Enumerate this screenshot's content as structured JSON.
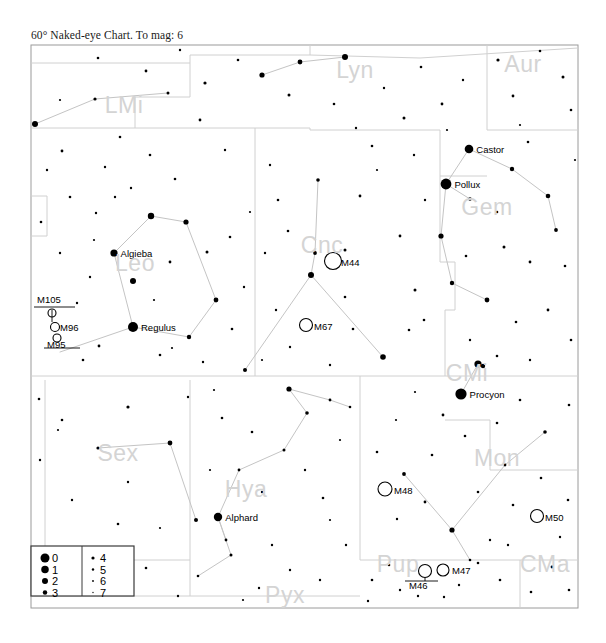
{
  "title": "60° Naked-eye Chart. To mag: 6",
  "chart_data": {
    "type": "scatter",
    "title": "60° Naked-eye Chart. To mag: 6",
    "xlabel": "",
    "ylabel": "",
    "xlim": [
      0,
      1
    ],
    "ylim": [
      0,
      1
    ],
    "grid": false,
    "legend_position": "bottom-left",
    "field_of_view_degrees": 60,
    "limiting_magnitude": 6,
    "legend": {
      "title": "",
      "entries": [
        {
          "mag": "0",
          "size": 9
        },
        {
          "mag": "1",
          "size": 7.5
        },
        {
          "mag": "2",
          "size": 6
        },
        {
          "mag": "3",
          "size": 4.5
        },
        {
          "mag": "4",
          "size": 3.2
        },
        {
          "mag": "5",
          "size": 2.4
        },
        {
          "mag": "6",
          "size": 1.8
        },
        {
          "mag": "7",
          "size": 1.3
        }
      ],
      "left_column": [
        "0",
        "1",
        "2",
        "3"
      ],
      "right_column": [
        "4",
        "5",
        "6",
        "7"
      ]
    },
    "constellations": [
      {
        "abbr": "Lyn",
        "name": "Lynx",
        "x": 355,
        "y": 78
      },
      {
        "abbr": "Aur",
        "name": "Auriga",
        "x": 523,
        "y": 72
      },
      {
        "abbr": "LMi",
        "name": "Leo Minor",
        "x": 124,
        "y": 113
      },
      {
        "abbr": "Gem",
        "name": "Gemini",
        "x": 487,
        "y": 215
      },
      {
        "abbr": "Leo",
        "name": "Leo",
        "x": 135,
        "y": 271
      },
      {
        "abbr": "Cnc",
        "name": "Cancer",
        "x": 322,
        "y": 253
      },
      {
        "abbr": "CMi",
        "name": "Canis Minor",
        "x": 467,
        "y": 381
      },
      {
        "abbr": "Sex",
        "name": "Sextans",
        "x": 118,
        "y": 461
      },
      {
        "abbr": "Mon",
        "name": "Monoceros",
        "x": 497,
        "y": 466
      },
      {
        "abbr": "Hya",
        "name": "Hydra",
        "x": 246,
        "y": 497
      },
      {
        "abbr": "Pup",
        "name": "Puppis",
        "x": 398,
        "y": 572
      },
      {
        "abbr": "CMa",
        "name": "Canis Major",
        "x": 545,
        "y": 572
      },
      {
        "abbr": "Pyx",
        "name": "Pyxis",
        "x": 285,
        "y": 603
      }
    ],
    "named_stars": [
      {
        "name": "Castor",
        "x": 469,
        "y": 149,
        "mag": 1,
        "r": 4.3
      },
      {
        "name": "Pollux",
        "x": 446,
        "y": 184,
        "mag": 1,
        "r": 5.4
      },
      {
        "name": "Algieba",
        "x": 114,
        "y": 253,
        "mag": 2,
        "r": 3.6
      },
      {
        "name": "Regulus",
        "x": 133,
        "y": 327,
        "mag": 1,
        "r": 5.0
      },
      {
        "name": "Procyon",
        "x": 461,
        "y": 394,
        "mag": 0,
        "r": 5.6
      },
      {
        "name": "Alphard",
        "x": 218,
        "y": 517,
        "mag": 2,
        "r": 4.2
      }
    ],
    "deep_sky_objects": [
      {
        "name": "M105",
        "x": 52,
        "y": 313,
        "r": 4.0,
        "label_x": 37,
        "label_y": 303,
        "label_pos": "above"
      },
      {
        "name": "M96",
        "x": 55,
        "y": 327,
        "r": 4.5,
        "label_x": 60,
        "label_y": 331,
        "label_pos": "right"
      },
      {
        "name": "M95",
        "x": 57,
        "y": 338,
        "r": 4.0,
        "label_x": 47,
        "label_y": 348,
        "label_pos": "below"
      },
      {
        "name": "M44",
        "x": 333,
        "y": 261,
        "r": 8.5,
        "label_x": 341,
        "label_y": 266,
        "label_pos": "right"
      },
      {
        "name": "M67",
        "x": 306,
        "y": 325,
        "r": 6.5,
        "label_x": 314,
        "label_y": 330,
        "label_pos": "right"
      },
      {
        "name": "M48",
        "x": 385,
        "y": 489,
        "r": 7.0,
        "label_x": 394,
        "label_y": 494,
        "label_pos": "right"
      },
      {
        "name": "M50",
        "x": 537,
        "y": 516,
        "r": 6.5,
        "label_x": 545,
        "label_y": 521,
        "label_pos": "right"
      },
      {
        "name": "M46",
        "x": 425,
        "y": 571,
        "r": 6.5,
        "label_x": 409,
        "label_y": 589,
        "label_pos": "below"
      },
      {
        "name": "M47",
        "x": 443,
        "y": 570,
        "r": 6.0,
        "label_x": 452,
        "label_y": 574,
        "label_pos": "right"
      }
    ]
  }
}
